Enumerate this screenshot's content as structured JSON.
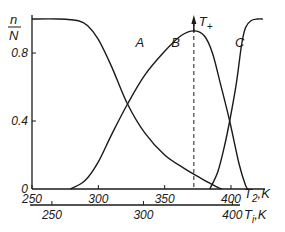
{
  "chart_data": {
    "type": "line",
    "title": "",
    "ylabel_num": "n",
    "ylabel_den": "N",
    "xlabel_top": "T",
    "xlabel_top_sub": "2",
    "xlabel_top_unit": ",K",
    "xlabel_bottom": "T",
    "xlabel_bottom_sub": "i",
    "xlabel_bottom_unit": ",K",
    "ylim": [
      0,
      1.0
    ],
    "xlim_T2": [
      250,
      425
    ],
    "yticks": [
      {
        "value": 0,
        "label": "0"
      },
      {
        "value": 0.4,
        "label": "0.4"
      },
      {
        "value": 0.8,
        "label": "0.8"
      }
    ],
    "xticks_T2": [
      {
        "value": 250,
        "label": "250"
      },
      {
        "value": 300,
        "label": "300"
      },
      {
        "value": 350,
        "label": "350"
      },
      {
        "value": 400,
        "label": "400"
      }
    ],
    "xticks_Ti": [
      {
        "value": 250,
        "label": "250",
        "x_T2": 265
      },
      {
        "value": 300,
        "label": "300",
        "x_T2": 334
      },
      {
        "value": 400,
        "label": "400",
        "x_T2": 401
      }
    ],
    "grid": false,
    "series": [
      {
        "name": "A",
        "x": [
          250,
          270,
          285,
          292,
          300,
          310,
          322,
          335,
          350,
          365,
          378,
          385,
          390,
          393
        ],
        "values": [
          1.0,
          1.0,
          0.99,
          0.96,
          0.88,
          0.72,
          0.5,
          0.33,
          0.2,
          0.12,
          0.06,
          0.03,
          0.01,
          0.0
        ]
      },
      {
        "name": "B",
        "x": [
          279,
          290,
          300,
          310,
          322,
          335,
          350,
          362,
          372,
          380,
          386,
          392,
          399,
          406,
          411,
          413
        ],
        "values": [
          0.0,
          0.05,
          0.16,
          0.32,
          0.5,
          0.67,
          0.81,
          0.9,
          0.93,
          0.9,
          0.8,
          0.62,
          0.4,
          0.15,
          0.02,
          0.0
        ]
      },
      {
        "name": "C",
        "x": [
          384,
          390,
          395,
          399,
          404,
          408,
          411,
          415,
          420,
          424
        ],
        "values": [
          0.0,
          0.1,
          0.25,
          0.4,
          0.62,
          0.85,
          0.95,
          0.99,
          1.0,
          1.0
        ]
      }
    ],
    "annotations": [
      {
        "type": "vline_dashed",
        "x": 372,
        "label": "T",
        "label_sub": "+",
        "arrow": "up"
      },
      {
        "type": "curve_label",
        "text": "A",
        "x": 328,
        "y": 0.8
      },
      {
        "type": "curve_label",
        "text": "B",
        "x": 355,
        "y": 0.8
      },
      {
        "type": "curve_label",
        "text": "C",
        "x": 403,
        "y": 0.8
      }
    ]
  }
}
